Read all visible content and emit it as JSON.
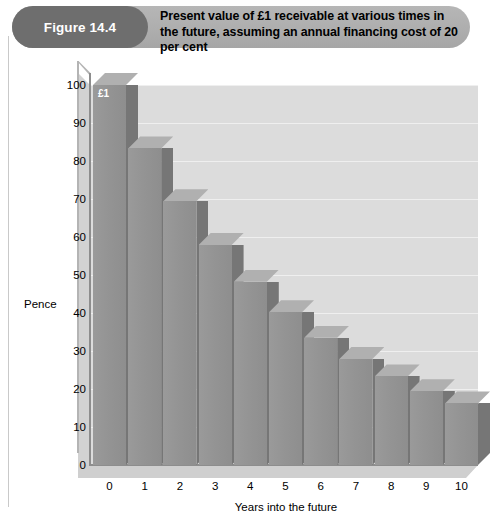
{
  "figure": {
    "number_label": "Figure 14.4",
    "title": "Present value of £1 receivable at various times in the future, assuming an annual financing cost of 20 per cent"
  },
  "chart_data": {
    "type": "bar",
    "title": "Present value of £1 receivable at various times in the future, assuming an annual financing cost of 20 per cent",
    "xlabel": "Years into the future",
    "ylabel": "Pence",
    "categories": [
      "0",
      "1",
      "2",
      "3",
      "4",
      "5",
      "6",
      "7",
      "8",
      "9",
      "10"
    ],
    "values": [
      100,
      83.3,
      69.4,
      57.9,
      48.2,
      40.2,
      33.5,
      27.9,
      23.3,
      19.4,
      16.2
    ],
    "ylim": [
      0,
      100
    ],
    "yticks": [
      0,
      10,
      20,
      30,
      40,
      50,
      60,
      70,
      80,
      90,
      100
    ],
    "grid": true,
    "legend": "none",
    "annotations": [
      {
        "series_index": 0,
        "text": "£1"
      }
    ],
    "style": {
      "bar_face_color": "#949494",
      "bar_side_color": "#767676",
      "bar_top_color": "#b0b0b0",
      "plot_background": "#dcdcdc",
      "gridline_color": "#efefef",
      "banner_color": "#aeaeae",
      "pill_color": "#6e6e6e"
    }
  }
}
